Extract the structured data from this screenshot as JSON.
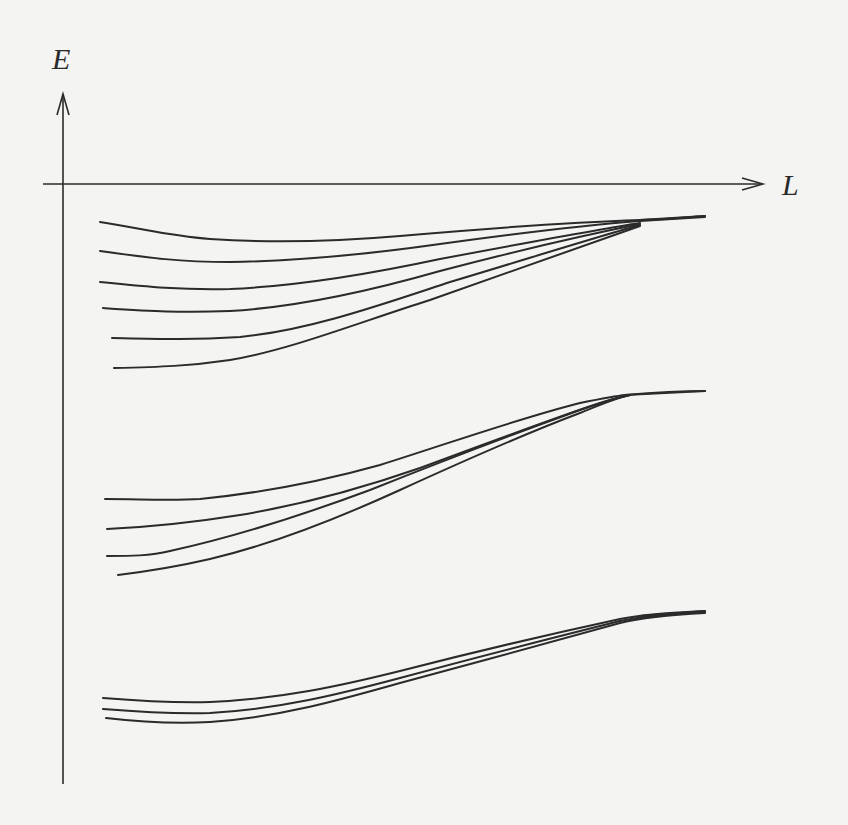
{
  "diagram": {
    "title": "",
    "y_axis_label": "E",
    "x_axis_label": "L",
    "colors": {
      "background": "#f4f4f2",
      "ink": "#2b2b2b"
    },
    "axes": {
      "y_axis": {
        "x": 63,
        "y_top": 93,
        "y_bottom": 784,
        "arrow": "up"
      },
      "x_axis": {
        "y": 184,
        "x_left": 43,
        "x_right": 763,
        "arrow": "right"
      }
    },
    "bands": [
      {
        "name": "upper-band",
        "curve_count": 6,
        "convergence_point": [
          640,
          220
        ],
        "curves": [
          "M100,222 C150,230 170,236 210,239 C270,243 330,242 400,236 C480,229 580,222 640,220 C670,219 690,217 705,216",
          "M100,251 C150,258 180,262 230,262 C300,261 370,254 440,244 C520,233 600,224 640,221 C670,219 690,218 705,217",
          "M100,282 C150,287 180,290 230,289 C300,286 370,274 440,259 C520,244 600,229 640,223",
          "M103,308 C150,311 180,313 230,311 C300,307 370,291 440,271 C520,250 600,232 640,224",
          "M112,338 C160,339 190,340 240,337 C310,330 380,305 450,282 C530,258 600,236 640,225",
          "M114,368 C160,367 190,366 230,360 C290,350 360,322 430,300 C520,268 600,240 640,226"
        ],
        "tail": "M640,220 L705,216"
      },
      {
        "name": "middle-band",
        "curve_count": 4,
        "convergence_point": [
          620,
          396
        ],
        "curves": [
          "M105,499 C140,499 170,501 200,499 C270,492 330,479 380,465 C450,443 520,418 580,403 C600,399 615,396 625,395 C660,392 690,391 705,391",
          "M107,529 C150,527 190,523 240,515 C300,505 360,489 420,468 C490,442 560,416 600,403 C612,399 620,397 630,395",
          "M107,556 C130,556 150,556 170,551 C230,538 300,516 370,490 C450,458 530,428 580,410 C600,403 615,398 630,395",
          "M118,575 C150,571 180,566 210,559 C270,545 330,522 400,490 C470,458 540,428 580,413 C600,405 615,398 630,395"
        ],
        "tail": "M625,395 L705,391"
      },
      {
        "name": "lower-band",
        "curve_count": 3,
        "convergence_point": [
          640,
          616
        ],
        "curves": [
          "M103,698 C140,701 170,703 210,702 C280,699 340,686 400,671 C470,653 560,632 620,619 C640,615 660,613 705,611",
          "M103,709 C140,712 170,714 210,713 C280,709 340,694 400,678 C470,659 560,636 620,621 C640,617 665,614 705,612",
          "M106,718 C140,722 170,724 210,722 C280,717 340,700 400,683 C470,664 560,640 620,623 C640,618 665,615 705,613"
        ],
        "tail": "M640,616 L705,611"
      }
    ]
  },
  "chart_data": {
    "type": "line",
    "title": "",
    "xlabel": "L",
    "ylabel": "E",
    "grid": false,
    "legend": null,
    "x": [
      0.06,
      0.2,
      0.4,
      0.6,
      0.8,
      0.92
    ],
    "series": [
      {
        "name": "band1-curve1",
        "values": [
          -0.06,
          -0.09,
          -0.09,
          -0.08,
          -0.06,
          -0.05
        ]
      },
      {
        "name": "band1-curve2",
        "values": [
          -0.11,
          -0.13,
          -0.12,
          -0.09,
          -0.06,
          -0.05
        ]
      },
      {
        "name": "band1-curve3",
        "values": [
          -0.16,
          -0.17,
          -0.15,
          -0.11,
          -0.07,
          -0.05
        ]
      },
      {
        "name": "band1-curve4",
        "values": [
          -0.2,
          -0.21,
          -0.18,
          -0.13,
          -0.07,
          -0.05
        ]
      },
      {
        "name": "band1-curve5",
        "values": [
          -0.25,
          -0.25,
          -0.21,
          -0.15,
          -0.08,
          -0.05
        ]
      },
      {
        "name": "band1-curve6",
        "values": [
          -0.3,
          -0.29,
          -0.24,
          -0.17,
          -0.09,
          -0.05
        ]
      },
      {
        "name": "band2-curve1",
        "values": [
          -0.53,
          -0.53,
          -0.49,
          -0.42,
          -0.36,
          -0.35
        ]
      },
      {
        "name": "band2-curve2",
        "values": [
          -0.58,
          -0.56,
          -0.52,
          -0.44,
          -0.37,
          -0.35
        ]
      },
      {
        "name": "band2-curve3",
        "values": [
          -0.62,
          -0.61,
          -0.55,
          -0.46,
          -0.37,
          -0.35
        ]
      },
      {
        "name": "band2-curve4",
        "values": [
          -0.66,
          -0.63,
          -0.57,
          -0.47,
          -0.38,
          -0.35
        ]
      },
      {
        "name": "band3-curve1",
        "values": [
          -0.86,
          -0.87,
          -0.84,
          -0.78,
          -0.73,
          -0.71
        ]
      },
      {
        "name": "band3-curve2",
        "values": [
          -0.88,
          -0.88,
          -0.85,
          -0.79,
          -0.73,
          -0.71
        ]
      },
      {
        "name": "band3-curve3",
        "values": [
          -0.89,
          -0.9,
          -0.86,
          -0.8,
          -0.74,
          -0.71
        ]
      }
    ],
    "ylim": [
      -1,
      0.15
    ],
    "xlim": [
      0,
      1
    ]
  }
}
